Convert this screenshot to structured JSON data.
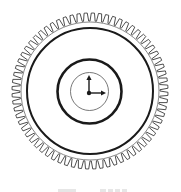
{
  "diagram": {
    "type": "gear-with-clock",
    "colors": {
      "background": "#ffffff",
      "stroke": "#1a1a1a",
      "teeth_stroke": "#3a3a3a",
      "thin_stroke": "#555555",
      "caption_fade": "#e6e6e6"
    },
    "center": {
      "x": 90,
      "y": 91
    },
    "gear": {
      "teeth_count": 68,
      "tooth_tip_radius": 78,
      "tooth_root_radius": 70,
      "root_circle_radius": 69
    },
    "rings": [
      {
        "name": "outer-thick-ring",
        "radius": 63,
        "stroke_width": 2
      },
      {
        "name": "inner-thick-ring",
        "radius": 32,
        "stroke_width": 2.6
      },
      {
        "name": "clock-face",
        "radius": 19,
        "stroke_width": 0.8
      }
    ],
    "clock_hands": {
      "pivot": {
        "x": 89,
        "y": 93
      },
      "vertical_hand_tip": {
        "x": 89,
        "y": 75
      },
      "horizontal_hand_tip": {
        "x": 106,
        "y": 93
      }
    },
    "caption": {
      "visible": "partial",
      "text": ""
    }
  }
}
